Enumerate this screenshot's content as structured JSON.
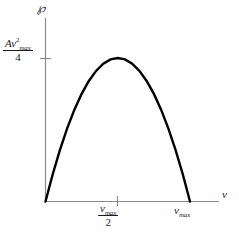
{
  "figure": {
    "background_color": "#fefefe",
    "axis_color": "#8a8a8a",
    "curve_color": "#000000",
    "text_color": "#1a1a1a"
  },
  "axes": {
    "y": {
      "symbol": "℘",
      "symbol_name": "script-p-power",
      "tick_label": {
        "numerator_leading": "A",
        "numerator_variable": "v",
        "numerator_exponent": "2",
        "numerator_subscript": "max",
        "denominator": "4"
      }
    },
    "x": {
      "symbol": "v",
      "tick_label_mid": {
        "numerator_variable": "v",
        "numerator_subscript": "max",
        "denominator": "2"
      },
      "tick_label_end": {
        "variable": "v",
        "subscript": "max"
      }
    }
  },
  "chart_data": {
    "type": "line",
    "title": "",
    "xlabel": "v",
    "ylabel": "℘",
    "grid": false,
    "legend": null,
    "equation": "P = A*v*(v_max - v)",
    "xlim": [
      0,
      1.15
    ],
    "ylim": [
      0,
      0.3
    ],
    "x_tick_values": [
      0.5,
      1.0
    ],
    "x_tick_labels": [
      "v_max/2",
      "v_max"
    ],
    "y_tick_values": [
      0.25
    ],
    "y_tick_labels": [
      "A v_max^2 / 4"
    ],
    "series": [
      {
        "name": "power",
        "x": [
          0.0,
          0.05,
          0.1,
          0.15,
          0.2,
          0.25,
          0.3,
          0.35,
          0.4,
          0.45,
          0.5,
          0.55,
          0.6,
          0.65,
          0.7,
          0.75,
          0.8,
          0.85,
          0.9,
          0.95,
          1.0
        ],
        "y": [
          0.0,
          0.0475,
          0.09,
          0.1275,
          0.16,
          0.1875,
          0.21,
          0.2275,
          0.24,
          0.2475,
          0.25,
          0.2475,
          0.24,
          0.2275,
          0.21,
          0.1875,
          0.16,
          0.1275,
          0.09,
          0.0475,
          0.0
        ]
      }
    ]
  }
}
